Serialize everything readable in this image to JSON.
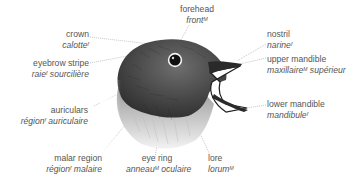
{
  "diagram": {
    "colors": {
      "text": "#555555",
      "leader_line": "#9a9a9a",
      "plumage_dark": "#3a3a3a",
      "plumage_light": "#d8d8d8",
      "background": "#ffffff"
    },
    "labels": [
      {
        "id": "crown",
        "en": "crown",
        "fr": "calotte",
        "gender": "f"
      },
      {
        "id": "eyebrow-stripe",
        "en": "eyebrow stripe",
        "fr_pre": "raie",
        "gender": "f",
        "fr_post": "sourcilière"
      },
      {
        "id": "auriculars",
        "en": "auriculars",
        "fr_pre": "région",
        "gender": "f",
        "fr_post": "auriculaire"
      },
      {
        "id": "malar-region",
        "en": "malar region",
        "fr_pre": "région",
        "gender": "f",
        "fr_post": "malaire"
      },
      {
        "id": "eye-ring",
        "en": "eye ring",
        "fr_pre": "anneau",
        "gender": "M",
        "fr_post": "oculaire"
      },
      {
        "id": "lore",
        "en": "lore",
        "fr": "lorum",
        "gender": "M"
      },
      {
        "id": "forehead",
        "en": "forehead",
        "fr": "front",
        "gender": "M"
      },
      {
        "id": "nostril",
        "en": "nostril",
        "fr": "narine",
        "gender": "f"
      },
      {
        "id": "upper-mandible",
        "en": "upper mandible",
        "fr_pre": "maxillaire",
        "gender": "M",
        "fr_post": "supérieur"
      },
      {
        "id": "lower-mandible",
        "en": "lower mandible",
        "fr": "mandibule",
        "gender": "f"
      }
    ]
  }
}
